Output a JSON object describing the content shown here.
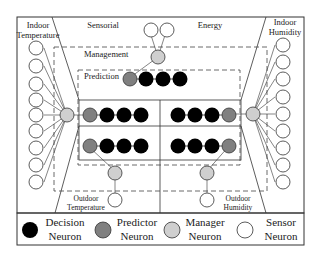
{
  "diagram": {
    "regions": {
      "indoor_temperature": [
        "Indoor",
        "Temperature"
      ],
      "sensorial": "Sensorial",
      "energy": "Energy",
      "indoor_humidity": [
        "Indoor",
        "Humidity"
      ],
      "management": "Management",
      "prediction": "Prediction",
      "outdoor_temperature": [
        "Outdoor",
        "Temperature"
      ],
      "outdoor_humidity": [
        "Outdoor",
        "Humidity"
      ]
    },
    "legend": [
      {
        "type": "decision",
        "line1": "Decision",
        "line2": "Neuron",
        "color": "#000000"
      },
      {
        "type": "predictor",
        "line1": "Predictor",
        "line2": "Neuron",
        "color": "#808080"
      },
      {
        "type": "manager",
        "line1": "Manager",
        "line2": "Neuron",
        "color": "#cfcfcf"
      },
      {
        "type": "sensor",
        "line1": "Sensor",
        "line2": "Neuron",
        "color": "#ffffff"
      }
    ],
    "colors": {
      "decision": "#000000",
      "predictor": "#808080",
      "manager": "#cfcfcf",
      "sensor": "#ffffff",
      "stroke": "#333333"
    }
  }
}
